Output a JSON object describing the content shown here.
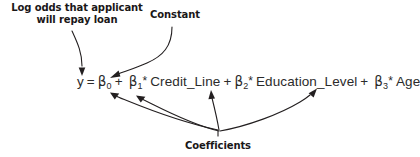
{
  "figure": {
    "background_color": "#ffffff",
    "ink_color": "#231f20",
    "annotation_color": "#1a1718",
    "equation_color": "#2b2b2b",
    "labels": {
      "log_odds": "Log odds that applicant will repay loan",
      "constant": "Constant",
      "coefficients": "Coefficients"
    },
    "equation": {
      "full_text": "y = β0 + β1* Credit_Line + β2* Education_Level + β3* Age",
      "response": "y",
      "equals": "=",
      "intercept_symbol": "β",
      "intercept_subscript": "0",
      "plus": "+",
      "multiply": "*",
      "terms": [
        {
          "coefficient_symbol": "β",
          "coefficient_subscript": "1",
          "variable": "Credit_Line"
        },
        {
          "coefficient_symbol": "β",
          "coefficient_subscript": "2",
          "variable": "Education_Level"
        },
        {
          "coefficient_symbol": "β",
          "coefficient_subscript": "3",
          "variable": "Age"
        }
      ]
    },
    "arrows": [
      {
        "name": "log-odds-to-y",
        "from_label": "Log odds that applicant will repay loan",
        "to_target": "y"
      },
      {
        "name": "constant-to-beta0",
        "from_label": "Constant",
        "to_target": "β0"
      },
      {
        "name": "coefficients-to-beta1",
        "from_label": "Coefficients",
        "to_target": "β1"
      },
      {
        "name": "coefficients-to-beta1b",
        "from_label": "Coefficients",
        "to_target": "β1"
      },
      {
        "name": "coefficients-to-beta2",
        "from_label": "Coefficients",
        "to_target": "β2"
      },
      {
        "name": "coefficients-to-beta3",
        "from_label": "Coefficients",
        "to_target": "β3"
      }
    ]
  }
}
